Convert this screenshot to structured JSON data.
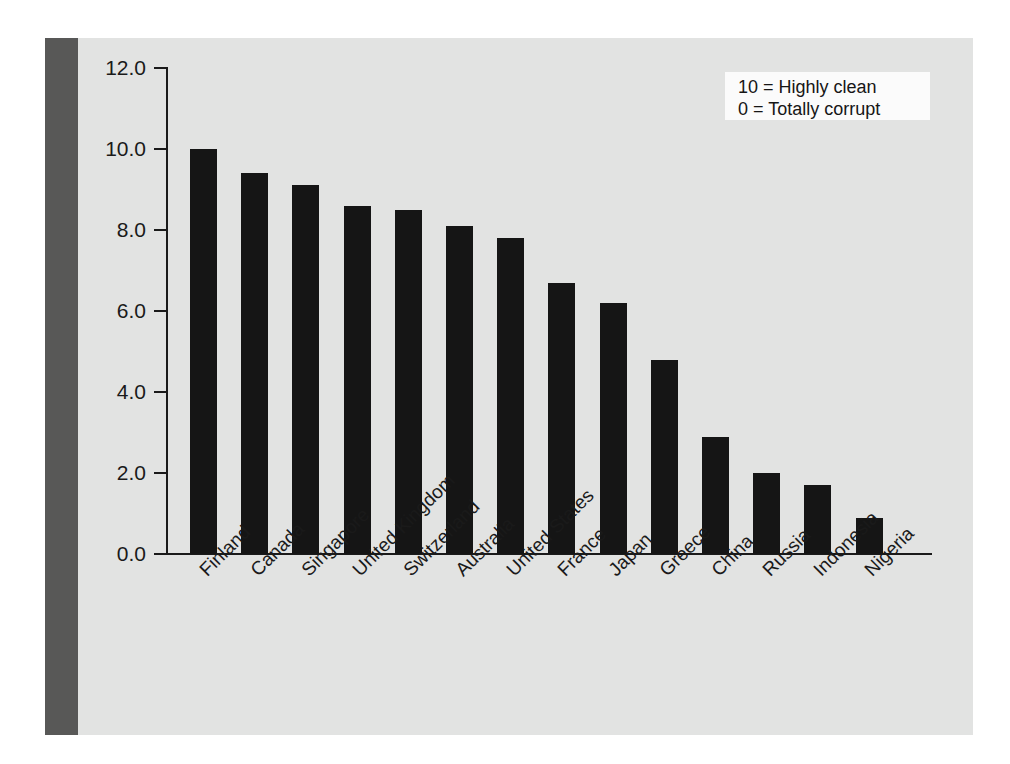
{
  "chart_data": {
    "type": "bar",
    "title": "",
    "xlabel": "",
    "ylabel": "",
    "categories": [
      "Finland",
      "Canada",
      "Singapore",
      "United Kingdom",
      "Switzerland",
      "Australia",
      "United States",
      "France",
      "Japan",
      "Greece",
      "China",
      "Russia",
      "Indonesia",
      "Nigeria"
    ],
    "values": [
      10.0,
      9.4,
      9.1,
      8.6,
      8.5,
      8.1,
      7.8,
      6.7,
      6.2,
      4.8,
      2.9,
      2.0,
      1.7,
      0.9
    ],
    "ylim": [
      0.0,
      12.0
    ],
    "ytick_labels": [
      "0.0",
      "2.0",
      "4.0",
      "6.0",
      "8.0",
      "10.0",
      "12.0"
    ],
    "ytick_values": [
      0.0,
      2.0,
      4.0,
      6.0,
      8.0,
      10.0,
      12.0
    ],
    "grid": false,
    "legend_position": "top-right",
    "bar_color": "#151515",
    "panel_color": "#e2e3e2",
    "band_color": "#585857",
    "axis_color": "#1a1a1a"
  },
  "legend": {
    "lines": [
      "10 = Highly clean",
      "0 = Totally corrupt"
    ]
  }
}
